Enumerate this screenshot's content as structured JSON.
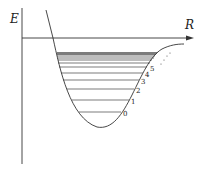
{
  "diagram": {
    "title": "",
    "axes": {
      "y_label": "E",
      "x_label": "R"
    },
    "curve": "Morse potential energy curve",
    "levels": {
      "labeled": [
        "0",
        "1",
        "2",
        "3",
        "4",
        "5"
      ],
      "ellipsis": "···"
    },
    "colors": {
      "stroke": "#333333",
      "background": "#ffffff"
    }
  }
}
